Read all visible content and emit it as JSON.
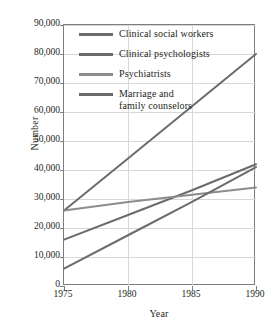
{
  "chart_data": {
    "type": "line",
    "title": "",
    "xlabel": "Year",
    "ylabel": "Number",
    "x": [
      1975,
      1980,
      1985,
      1990
    ],
    "xlim": [
      1975,
      1990
    ],
    "ylim": [
      0,
      90000
    ],
    "xticks": [
      "1975",
      "1980",
      "1985",
      "1990"
    ],
    "yticks": [
      "0",
      "10,000",
      "20,000",
      "30,000",
      "40,000",
      "50,000",
      "60,000",
      "70,000",
      "80,000",
      "90,000"
    ],
    "grid": true,
    "legend_position": "top-left inside plot",
    "series": [
      {
        "name": "Clinical social workers",
        "color": "#6b6b6b",
        "values": [
          26000,
          44000,
          62000,
          80000
        ]
      },
      {
        "name": "Clinical psychologists",
        "color": "#6b6b6b",
        "values": [
          16000,
          24500,
          33000,
          42000
        ]
      },
      {
        "name": "Psychiatrists",
        "color": "#8c8c8c",
        "values": [
          26000,
          29000,
          31500,
          34000
        ]
      },
      {
        "name": "Marriage and\nfamily counselors",
        "color": "#6b6b6b",
        "values": [
          6000,
          17500,
          29000,
          41000
        ]
      }
    ]
  },
  "legend": {
    "items": [
      {
        "label": "Clinical social workers"
      },
      {
        "label": "Clinical psychologists"
      },
      {
        "label": "Psychiatrists"
      },
      {
        "label": "Marriage and\nfamily counselors"
      }
    ]
  },
  "colors": {
    "line_dark": "#6b6b6b",
    "line_light": "#8c8c8c",
    "grid": "#d8d8d8",
    "frame": "#7d7d7d",
    "text": "#231f20"
  }
}
